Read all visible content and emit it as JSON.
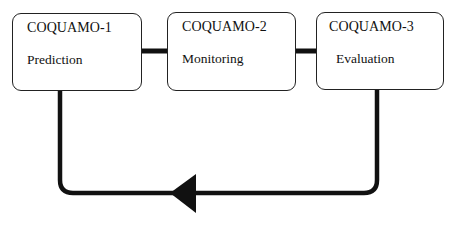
{
  "diagram": {
    "type": "cycle-flow",
    "nodes": [
      {
        "id": "coquamo-1",
        "title": "COQUAMO-1",
        "subtitle": "Prediction"
      },
      {
        "id": "coquamo-2",
        "title": "COQUAMO-2",
        "subtitle": "Monitoring"
      },
      {
        "id": "coquamo-3",
        "title": "COQUAMO-3",
        "subtitle": "Evaluation"
      }
    ],
    "edges": [
      {
        "from": "coquamo-1",
        "to": "coquamo-2",
        "style": "thick-line"
      },
      {
        "from": "coquamo-2",
        "to": "coquamo-3",
        "style": "thick-line"
      },
      {
        "from": "coquamo-3",
        "to": "coquamo-1",
        "style": "feedback-loop-arrow",
        "arrow_direction": "left"
      }
    ],
    "colors": {
      "line": "#111111",
      "box_border": "#222222",
      "background": "#ffffff"
    }
  }
}
